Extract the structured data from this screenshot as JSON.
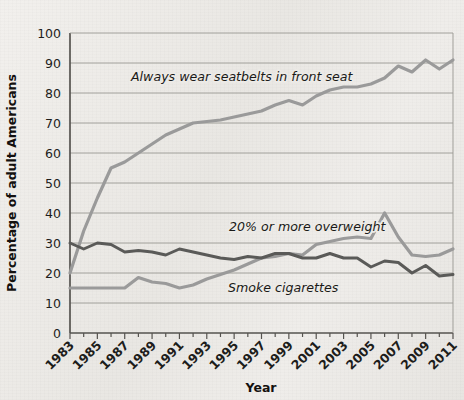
{
  "chart_data": {
    "type": "line",
    "title": "",
    "xlabel": "Year",
    "ylabel": "Percentage of adult Americans",
    "xlim": [
      1983,
      2011
    ],
    "ylim": [
      0,
      100
    ],
    "grid": true,
    "legend_position": "inline-annotations",
    "x": [
      1983,
      1984,
      1985,
      1986,
      1987,
      1988,
      1989,
      1990,
      1991,
      1992,
      1993,
      1994,
      1995,
      1996,
      1997,
      1998,
      1999,
      2000,
      2001,
      2002,
      2003,
      2004,
      2005,
      2006,
      2007,
      2008,
      2009,
      2010,
      2011
    ],
    "xticks": [
      "1983",
      "1985",
      "1987",
      "1989",
      "1991",
      "1993",
      "1995",
      "1997",
      "1999",
      "2001",
      "2003",
      "2005",
      "2007",
      "2009",
      "2011"
    ],
    "yticks": [
      "0",
      "10",
      "20",
      "30",
      "40",
      "50",
      "60",
      "70",
      "80",
      "90",
      "100"
    ],
    "series": [
      {
        "name": "Always wear seatbelts in front seat",
        "color": "#9a9a9a",
        "annotation": "Always wear seatbelts in front seat",
        "values": [
          20,
          34,
          45,
          55,
          57,
          60,
          63,
          66,
          68,
          70,
          70.5,
          71,
          72,
          73,
          74,
          76,
          77.5,
          76,
          79,
          81,
          82,
          82,
          83,
          85,
          89,
          87,
          91,
          88,
          91
        ]
      },
      {
        "name": "20% or more overweight",
        "color": "#9a9a9a",
        "annotation": "20% or more overweight",
        "values": [
          15,
          15,
          15,
          15,
          15,
          18.5,
          17,
          16.5,
          15,
          16,
          18,
          19.5,
          21,
          23,
          25,
          25.5,
          26.5,
          26,
          29.5,
          30.5,
          31.5,
          32,
          31.5,
          40,
          32,
          26,
          25.5,
          26,
          28
        ]
      },
      {
        "name": "Smoke cigarettes",
        "color": "#5a5a58",
        "annotation": "Smoke cigarettes",
        "values": [
          30,
          28,
          30,
          29.5,
          27,
          27.5,
          27,
          26,
          28,
          27,
          26,
          25,
          24.5,
          25.5,
          25,
          26.5,
          26.5,
          25,
          25,
          26.5,
          25,
          25,
          22,
          24,
          23.5,
          20,
          22.5,
          19,
          19.5
        ]
      }
    ],
    "annotations": [
      {
        "label": "Always wear seatbelts in front seat",
        "x_px": 131,
        "y_px": 81
      },
      {
        "label": "20% or more overweight",
        "x_px": 229,
        "y_px": 231
      },
      {
        "label": "Smoke cigarettes",
        "x_px": 228,
        "y_px": 292
      }
    ]
  },
  "axes": {
    "x_title": "Year",
    "y_title": "Percentage of adult Americans"
  },
  "colors": {
    "background": "#eceae6",
    "grid": "#9a9893",
    "axis": "#55534f",
    "seatbelt": "#9a9a9a",
    "overweight": "#9a9a9a",
    "smoking": "#5a5a58",
    "text": "#1d1d1b"
  }
}
